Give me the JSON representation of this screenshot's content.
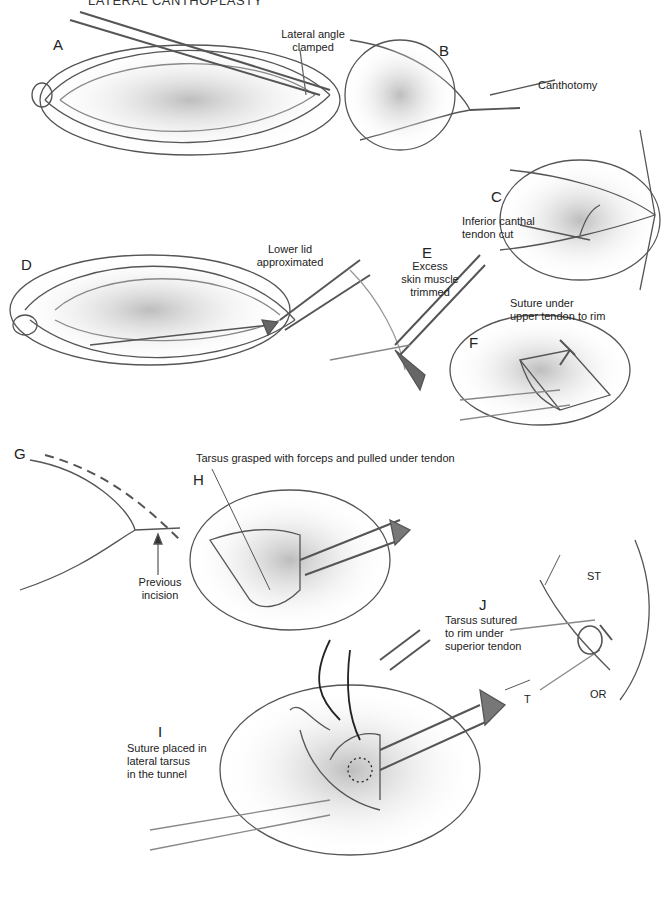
{
  "header": {
    "title": "LATERAL CANTHOPLASTY"
  },
  "panels": {
    "A": {
      "letter": "A",
      "caption_line1": "Lateral angle",
      "caption_line2": "clamped"
    },
    "B": {
      "letter": "B",
      "caption": "Canthotomy"
    },
    "C": {
      "letter": "C",
      "caption_line1": "Inferior canthal",
      "caption_line2": "tendon cut"
    },
    "D": {
      "letter": "D",
      "caption_line1": "Lower lid",
      "caption_line2": "approximated"
    },
    "E": {
      "letter": "E",
      "caption_line1": "Excess",
      "caption_line2": "skin muscle",
      "caption_line3": "trimmed"
    },
    "F": {
      "letter": "F",
      "caption_line1": "Suture under",
      "caption_line2": "upper tendon to rim"
    },
    "G": {
      "letter": "G",
      "caption_line1": "Previous",
      "caption_line2": "incision"
    },
    "H": {
      "letter": "H",
      "caption": "Tarsus grasped with forceps and pulled under tendon"
    },
    "I": {
      "letter": "I",
      "caption_line1": "Suture placed in",
      "caption_line2": "lateral tarsus",
      "caption_line3": "in the tunnel"
    },
    "J": {
      "letter": "J",
      "caption_line1": "Tarsus sutured",
      "caption_line2": "to rim under",
      "caption_line3": "superior tendon",
      "labels": {
        "st": "ST",
        "t": "T",
        "or": "OR"
      }
    }
  }
}
